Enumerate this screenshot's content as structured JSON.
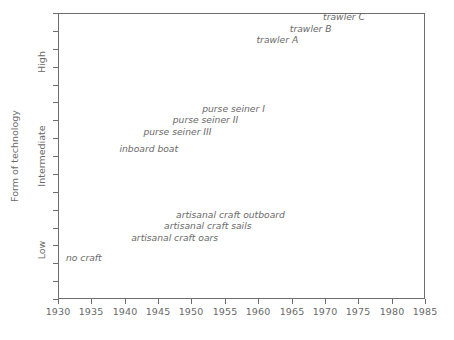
{
  "chart_data": {
    "type": "scatter",
    "title": "",
    "subtitle": "",
    "xlabel": "",
    "ylabel": "Form of technology",
    "xlim": [
      1930,
      1985
    ],
    "ylim": [
      0,
      1
    ],
    "grid": false,
    "legend": null,
    "x_ticks": [
      "1930",
      "1935",
      "1940",
      "1945",
      "1950",
      "1955",
      "1960",
      "1965",
      "1970",
      "1975",
      "1980",
      "1985"
    ],
    "x_tick_values": [
      1930,
      1935,
      1940,
      1945,
      1950,
      1955,
      1960,
      1965,
      1970,
      1975,
      1980,
      1985
    ],
    "y_ticks": [
      "Low",
      "Intermediate",
      "High"
    ],
    "y_tick_values": [
      0.17,
      0.5,
      0.83
    ],
    "annotations": [
      {
        "label": "trawler C",
        "x": 1976,
        "y": 0.985,
        "align": "right"
      },
      {
        "label": "trawler B",
        "x": 1971,
        "y": 0.945,
        "align": "right"
      },
      {
        "label": "trawler A",
        "x": 1966,
        "y": 0.905,
        "align": "right"
      },
      {
        "label": "purse seiner I",
        "x": 1961,
        "y": 0.665,
        "align": "right"
      },
      {
        "label": "purse seiner II",
        "x": 1957,
        "y": 0.625,
        "align": "right"
      },
      {
        "label": "purse seiner III",
        "x": 1953,
        "y": 0.585,
        "align": "right"
      },
      {
        "label": "inboard boat",
        "x": 1948,
        "y": 0.525,
        "align": "right"
      },
      {
        "label": "artisanal craft outboard",
        "x": 1964,
        "y": 0.295,
        "align": "right"
      },
      {
        "label": "artisanal craft sails",
        "x": 1959,
        "y": 0.255,
        "align": "right"
      },
      {
        "label": "artisanal craft oars",
        "x": 1954,
        "y": 0.215,
        "align": "right"
      },
      {
        "label": "no craft",
        "x": 1930,
        "y": 0.145,
        "align": "left"
      }
    ],
    "colors": {
      "text": "#6a6a6a",
      "axis": "#6d6d6d",
      "background": "#ffffff"
    }
  },
  "axis": {
    "y_title": "Form of technology",
    "x_tick_labels": [
      "1930",
      "1935",
      "1940",
      "1945",
      "1950",
      "1955",
      "1960",
      "1965",
      "1970",
      "1975",
      "1980",
      "1985"
    ],
    "y_tick_labels": [
      "High",
      "Intermediate",
      "Low"
    ]
  },
  "labels": {
    "trawler_c": "trawler C",
    "trawler_b": "trawler B",
    "trawler_a": "trawler A",
    "purse_seiner_1": "purse seiner I",
    "purse_seiner_2": "purse seiner II",
    "purse_seiner_3": "purse seiner III",
    "inboard_boat": "inboard boat",
    "artisanal_outboard": "artisanal craft outboard",
    "artisanal_sails": "artisanal craft sails",
    "artisanal_oars": "artisanal craft oars",
    "no_craft": "no craft"
  }
}
